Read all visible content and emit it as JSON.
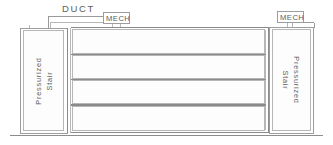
{
  "drawing": {
    "title": "Building Section - Pressurized Stair / Duct / Mechanical",
    "canvas": {
      "width": 333,
      "height": 145
    },
    "ink_color": "#9a9a9a",
    "background": "#ffffff"
  },
  "annotations": {
    "duct_label": "DUCT",
    "mech_label_left": "MECH",
    "mech_label_right": "MECH",
    "stair_left_line1": "Pressurized",
    "stair_left_line2": "Stair",
    "stair_right_line1": "Pressurized",
    "stair_right_line2": "Stair"
  },
  "elements": {
    "left_stair_shaft": "left-pressurized-stair-shaft",
    "right_stair_shaft": "right-pressurized-stair-shaft",
    "duct_run": "horizontal-duct-run",
    "mech_room_left": "left-mechanical-room",
    "mech_room_right": "right-mechanical-room",
    "ground_line": "ground-line",
    "floor_count": 4
  }
}
